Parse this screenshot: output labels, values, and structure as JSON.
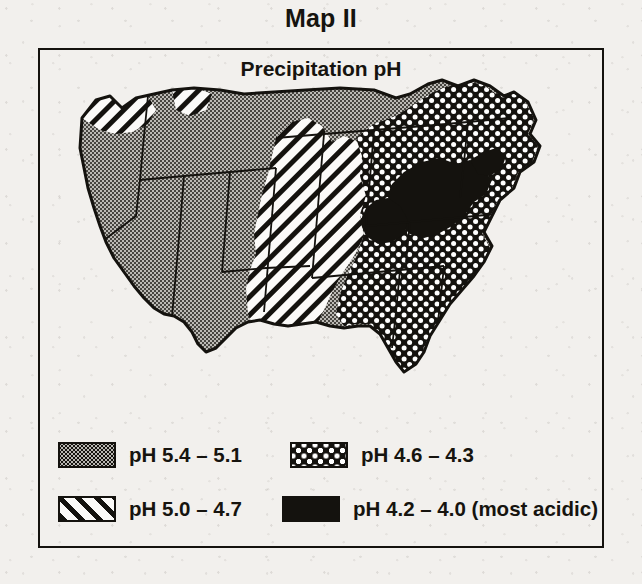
{
  "title": "Map II",
  "map": {
    "subtitle": "Precipitation pH",
    "region": "Contiguous United States",
    "zones": [
      {
        "key": "ph_5_4_5_1",
        "pattern": "fine-dot-stipple",
        "areas": "Pacific coast, Great Basin, Northern Plains, West Texas"
      },
      {
        "key": "ph_5_0_4_7",
        "pattern": "diagonal-hatch",
        "areas": "Washington, Rockies, Central Plains, Texas, Gulf transition"
      },
      {
        "key": "ph_4_6_4_3",
        "pattern": "checkerboard",
        "areas": "Midwest, Southeast, Florida, New England"
      },
      {
        "key": "ph_4_2_4_0",
        "pattern": "solid-black",
        "areas": "Ohio Valley, Pennsylvania, New York"
      }
    ]
  },
  "legend": {
    "entries": [
      {
        "pattern": "fine-dot-stipple",
        "label": "pH 5.4 – 5.1"
      },
      {
        "pattern": "checkerboard",
        "label": "pH 4.6 – 4.3"
      },
      {
        "pattern": "diagonal-hatch",
        "label": "pH 5.0 – 4.7"
      },
      {
        "pattern": "solid-black",
        "label": "pH 4.2 – 4.0 (most acidic)"
      }
    ]
  },
  "colors": {
    "ink": "#14120e",
    "paper": "#f2f0ed",
    "stipple_fill": "#b9b7b2"
  }
}
